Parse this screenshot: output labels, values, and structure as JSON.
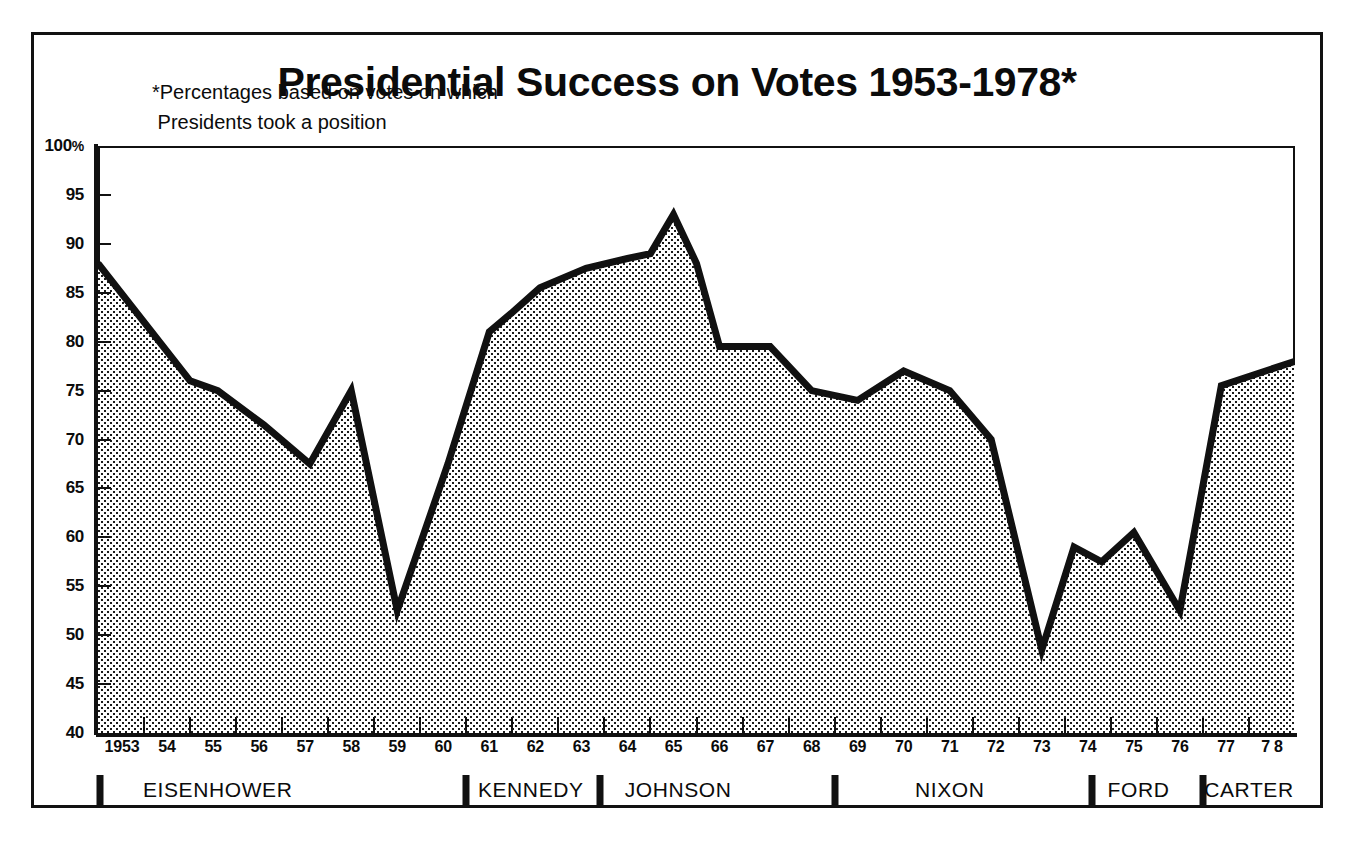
{
  "title": "Presidential Success on Votes 1953-1978*",
  "annotation": {
    "line1": "*Percentages based on votes on which",
    "line2": " Presidents took a position"
  },
  "colors": {
    "ink": "#111111",
    "fill_pattern": "dotted-stipple",
    "background": "#ffffff"
  },
  "axis": {
    "y_title": "",
    "y_unit": "%",
    "y_top_label": "100",
    "y_labels": [
      "100%",
      "95",
      "90",
      "85",
      "80",
      "75",
      "70",
      "65",
      "60",
      "55",
      "50",
      "45",
      "40"
    ],
    "x_labels": [
      "1953",
      "54",
      "55",
      "56",
      "57",
      "58",
      "59",
      "60",
      "61",
      "62",
      "63",
      "64",
      "65",
      "66",
      "67",
      "68",
      "69",
      "70",
      "71",
      "72",
      "73",
      "74",
      "75",
      "76",
      "77",
      "7 8"
    ]
  },
  "presidents": [
    {
      "name": "EISENHOWER",
      "start": 1953.0,
      "end": 1961.0,
      "label_at": 1955.6
    },
    {
      "name": "KENNEDY",
      "start": 1961.0,
      "end": 1963.9,
      "label_at": 1962.4
    },
    {
      "name": "JOHNSON",
      "start": 1963.9,
      "end": 1969.0,
      "label_at": 1965.6
    },
    {
      "name": "NIXON",
      "start": 1969.0,
      "end": 1974.6,
      "label_at": 1971.5
    },
    {
      "name": "FORD",
      "start": 1974.6,
      "end": 1977.0,
      "label_at": 1975.6
    },
    {
      "name": "CARTER",
      "start": 1977.0,
      "end": 1979.0,
      "label_at": 1978.0
    }
  ],
  "chart_data": {
    "type": "area",
    "title": "Presidential Success on Votes 1953-1978*",
    "subtitle": "*Percentages based on votes on which Presidents took a position",
    "xlabel": "",
    "ylabel": "Percent of votes won (%)",
    "xlim": [
      1953.0,
      1979.0
    ],
    "ylim": [
      40,
      100
    ],
    "y_ticks": [
      40,
      45,
      50,
      55,
      60,
      65,
      70,
      75,
      80,
      85,
      90,
      95,
      100
    ],
    "grid": false,
    "legend": "none",
    "fill": "dotted stipple below line",
    "line_width_px": 7,
    "x": [
      1953.0,
      1954.0,
      1955.0,
      1955.6,
      1956.6,
      1957.6,
      1958.5,
      1959.5,
      1960.6,
      1961.5,
      1962.0,
      1962.6,
      1963.6,
      1964.5,
      1965.0,
      1965.5,
      1966.0,
      1966.5,
      1967.6,
      1968.5,
      1969.5,
      1970.5,
      1971.5,
      1972.4,
      1973.5,
      1974.2,
      1974.8,
      1975.5,
      1976.5,
      1977.4,
      1979.0
    ],
    "x_tick_labels": [
      "1953",
      "54",
      "55",
      "56",
      "57",
      "58",
      "59",
      "60",
      "61",
      "62",
      "63",
      "64",
      "65",
      "66",
      "67",
      "68",
      "69",
      "70",
      "71",
      "72",
      "73",
      "74",
      "75",
      "76",
      "77",
      "78"
    ],
    "values": [
      88.0,
      82.0,
      76.0,
      75.0,
      71.5,
      67.5,
      75.0,
      52.5,
      67.5,
      81.0,
      83.0,
      85.5,
      87.5,
      88.5,
      89.0,
      93.0,
      88.0,
      79.5,
      79.5,
      75.0,
      74.0,
      77.0,
      75.0,
      70.0,
      48.5,
      59.0,
      57.5,
      60.5,
      52.5,
      75.5,
      78.0
    ],
    "annotations": [
      {
        "text": "Peak 93% in 1965 (Johnson)",
        "x": 1965.5,
        "y": 93.0
      },
      {
        "text": "Low 48.5% in 1973 (Nixon)",
        "x": 1973.5,
        "y": 48.5
      }
    ],
    "series": [
      {
        "name": "Presidential success rate on votes",
        "values": [
          88.0,
          82.0,
          76.0,
          75.0,
          71.5,
          67.5,
          75.0,
          52.5,
          67.5,
          81.0,
          83.0,
          85.5,
          87.5,
          88.5,
          89.0,
          93.0,
          88.0,
          79.5,
          79.5,
          75.0,
          74.0,
          77.0,
          75.0,
          70.0,
          48.5,
          59.0,
          57.5,
          60.5,
          52.5,
          75.5,
          78.0
        ]
      }
    ]
  }
}
